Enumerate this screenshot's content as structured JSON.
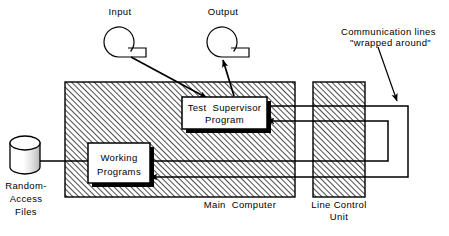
{
  "figure": {
    "type": "block-diagram",
    "background_color": "#ffffff",
    "line_color": "#000000",
    "hatch_color": "#1a1a1a"
  },
  "labels": {
    "input": "Input",
    "output": "Output",
    "communication_lines_1": "Communication lines",
    "communication_lines_2": "\"wrapped around\"",
    "random_access_1": "Random-",
    "random_access_2": "Access",
    "random_access_3": "Files",
    "main_computer": "Main  Computer",
    "line_control_1": "Line Control",
    "line_control_2": "Unit"
  },
  "boxes": {
    "test_supervisor_1": "Test  Supervisor",
    "test_supervisor_2": "Program",
    "working_1": "Working",
    "working_2": "Programs"
  },
  "regions": {
    "main_computer": {
      "x": 65,
      "y": 82,
      "w": 230,
      "h": 115,
      "hatched": true
    },
    "line_control_unit": {
      "x": 313,
      "y": 82,
      "w": 52,
      "h": 115,
      "hatched": true
    }
  },
  "nodes": {
    "test_supervisor_program": {
      "x": 182,
      "y": 97,
      "w": 85,
      "h": 32,
      "shadow": true
    },
    "working_programs": {
      "x": 88,
      "y": 143,
      "w": 62,
      "h": 40,
      "shadow": true
    },
    "random_access_files": {
      "x": 10,
      "y": 136,
      "w": 30,
      "h": 38,
      "shape": "cylinder"
    },
    "input_terminal": {
      "cx": 119,
      "cy": 42,
      "r": 15,
      "shape": "online-storage"
    },
    "output_terminal": {
      "cx": 222,
      "cy": 42,
      "r": 15,
      "shape": "online-storage"
    }
  },
  "connections": [
    {
      "name": "input-to-supervisor",
      "from": "input_terminal",
      "to": "test_supervisor_program",
      "arrow": "to"
    },
    {
      "name": "supervisor-to-output",
      "from": "test_supervisor_program",
      "to": "output_terminal",
      "arrow": "to"
    },
    {
      "name": "files-to-working",
      "from": "random_access_files",
      "to": "working_programs",
      "arrow": "none"
    },
    {
      "name": "supervisor-out-upper",
      "from": "test_supervisor_program",
      "to": "wrap_outer",
      "arrow": "none"
    },
    {
      "name": "supervisor-in-lower",
      "from": "wrap_inner",
      "to": "test_supervisor_program",
      "arrow": "to"
    },
    {
      "name": "working-out-upper",
      "from": "working_programs",
      "to": "wrap_inner",
      "arrow": "none"
    },
    {
      "name": "working-in-lower",
      "from": "wrap_outer",
      "to": "working_programs",
      "arrow": "to"
    },
    {
      "name": "wrapped-around-callout",
      "from": "communication_lines_label",
      "to": "wrap_outer",
      "arrow": "to"
    }
  ]
}
